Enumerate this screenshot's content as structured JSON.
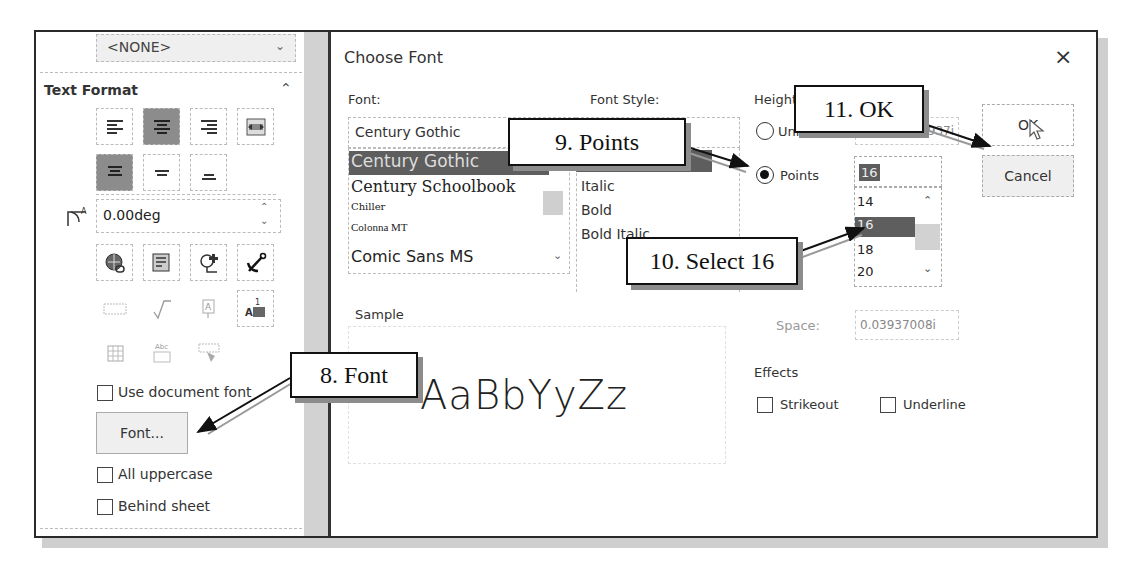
{
  "left_panel": {
    "layer_dropdown": {
      "value": "<NONE>"
    },
    "section_title": "Text Format",
    "alignment_buttons": [
      {
        "name": "align-left-icon",
        "active": false
      },
      {
        "name": "align-center-icon",
        "active": true
      },
      {
        "name": "align-right-icon",
        "active": false
      },
      {
        "name": "fit-text-icon",
        "active": false
      },
      {
        "name": "align-top-icon",
        "active": true
      },
      {
        "name": "align-middle-icon",
        "active": false
      },
      {
        "name": "align-bottom-icon",
        "active": false
      }
    ],
    "angle": {
      "value": "0.00deg"
    },
    "insert_buttons": [
      "link-icon",
      "link-to-property-icon",
      "add-balloon-icon",
      "anchor-icon"
    ],
    "disabled_buttons": [
      "border-icon",
      "symbol-icon",
      "stack-icon",
      "annotation-anchor-icon",
      "table-icon",
      "spell-icon",
      "format-painter-icon"
    ],
    "use_document_font": {
      "label": "Use document font",
      "checked": false
    },
    "font_button": "Font...",
    "all_uppercase": {
      "label": "All uppercase",
      "checked": false
    },
    "behind_sheet": {
      "label": "Behind sheet",
      "checked": false
    }
  },
  "dialog": {
    "title": "Choose Font",
    "close": "×",
    "font_label": "Font:",
    "font_value": "Century Gothic",
    "font_list": [
      "Century Gothic",
      "Century Schoolbook",
      "Chiller",
      "Colonna MT",
      "Comic Sans MS"
    ],
    "font_selected": "Century Gothic",
    "style_label": "Font Style:",
    "style_list": [
      "Regular",
      "Italic",
      "Bold",
      "Bold Italic"
    ],
    "height_label": "Height",
    "units_label": "Units",
    "units_value": "0.1968503937i",
    "points_label": "Points",
    "points_value": "16",
    "points_list": [
      "14",
      "16",
      "18",
      "20"
    ],
    "points_selected": "16",
    "space_label": "Space:",
    "space_value": "0.03937008i",
    "sample_label": "Sample",
    "sample_text": "AaBbYyZz",
    "effects_label": "Effects",
    "strikeout": {
      "label": "Strikeout",
      "checked": false
    },
    "underline": {
      "label": "Underline",
      "checked": false
    },
    "ok": "OK",
    "cancel": "Cancel"
  },
  "callouts": {
    "step8": "8. Font",
    "step9": "9. Points",
    "step10": "10. Select 16",
    "step11": "11. OK"
  }
}
